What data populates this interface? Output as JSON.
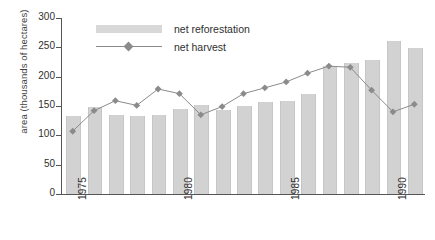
{
  "chart_data": {
    "type": "bar",
    "title": "",
    "xlabel": "",
    "ylabel": "area (thousands of hectares)",
    "ylim": [
      0,
      300
    ],
    "yticks": [
      0,
      50,
      100,
      150,
      200,
      250,
      300
    ],
    "ytick_labels": [
      "0",
      "50",
      "100",
      "150",
      "200",
      "250",
      "300"
    ],
    "grid": false,
    "legend_position": "top-left-inside",
    "categories": [
      1975,
      1976,
      1977,
      1978,
      1979,
      1980,
      1981,
      1982,
      1983,
      1984,
      1985,
      1986,
      1987,
      1988,
      1989,
      1990,
      1991
    ],
    "xtick_labels": [
      "1975",
      "1980",
      "1985",
      "1990"
    ],
    "xtick_values": [
      1975,
      1980,
      1985,
      1990
    ],
    "series": [
      {
        "name": "net reforestation",
        "kind": "bar",
        "color": "#d2d2d2",
        "values": [
          133,
          148,
          135,
          133,
          134,
          145,
          152,
          144,
          150,
          157,
          158,
          170,
          218,
          223,
          229,
          260,
          249
        ]
      },
      {
        "name": "net harvest",
        "kind": "line",
        "color": "#8b8b8b",
        "marker": "diamond",
        "values": [
          107,
          142,
          159,
          151,
          179,
          171,
          135,
          149,
          171,
          181,
          191,
          206,
          218,
          216,
          177,
          140,
          153
        ]
      }
    ]
  },
  "legend": {
    "items": [
      {
        "label": "net reforestation",
        "swatch": "bar-swatch"
      },
      {
        "label": "net harvest",
        "swatch": "line-marker-swatch"
      }
    ]
  },
  "colors": {
    "bar": "#d2d2d2",
    "line": "#8b8b8b",
    "marker": "#8b8b8b",
    "axis": "#555555",
    "text": "#2f2f2f",
    "background": "#ffffff"
  }
}
